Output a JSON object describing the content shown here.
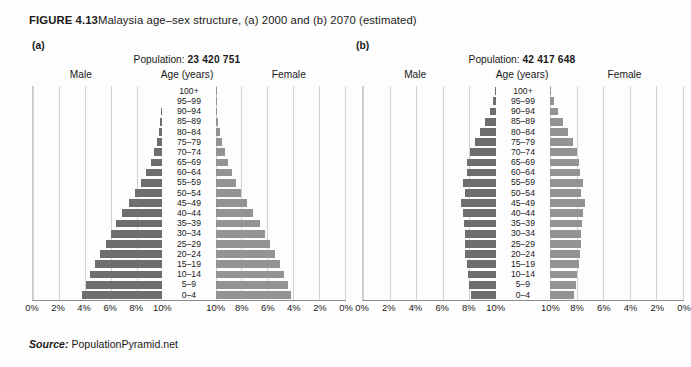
{
  "figure": {
    "number": "FIGURE 4.13",
    "title": "Malaysia age–sex structure, (a) 2000 and (b) 2070 (estimated)"
  },
  "source": {
    "label": "Source:",
    "text": " PopulationPyramid.net"
  },
  "colors": {
    "male_bar": "#6e6e6e",
    "female_bar": "#939393",
    "gridline": "#d2d2d2",
    "axis": "#8c8c8c",
    "background": "#fdfdfd"
  },
  "labels": {
    "population_prefix": "Population: ",
    "male": "Male",
    "female": "Female",
    "age": "Age (years)"
  },
  "panels": [
    {
      "letter": "(a)",
      "population": "23 420 751"
    },
    {
      "letter": "(b)",
      "population": "42 417 648"
    }
  ],
  "chart_data": [
    {
      "type": "bar",
      "subtype": "population-pyramid",
      "title": "Malaysia age–sex structure (a) 2000",
      "panel": "(a)",
      "population_total": "23 420 751",
      "xlabel": "",
      "ylabel": "Age (years)",
      "xlim": [
        0,
        10
      ],
      "xunit": "%",
      "xticks": [
        "10%",
        "8%",
        "6%",
        "4%",
        "2%",
        "0%",
        "0%",
        "2%",
        "4%",
        "6%",
        "8%",
        "10%"
      ],
      "grid": true,
      "legend": [
        "Male",
        "Female"
      ],
      "legend_position": "top",
      "categories": [
        "100+",
        "95–99",
        "90–94",
        "85–89",
        "80–84",
        "75–79",
        "70–74",
        "65–69",
        "60–64",
        "55–59",
        "50–54",
        "45–49",
        "40–44",
        "35–39",
        "30–34",
        "25–29",
        "20–24",
        "15–19",
        "10–14",
        "5–9",
        "0–4"
      ],
      "series": [
        {
          "name": "Male",
          "side": "left",
          "values": [
            0.01,
            0.03,
            0.08,
            0.17,
            0.3,
            0.45,
            0.65,
            0.9,
            1.25,
            1.65,
            2.1,
            2.6,
            3.1,
            3.6,
            4.0,
            4.4,
            4.8,
            5.2,
            5.6,
            5.9,
            6.2
          ]
        },
        {
          "name": "Female",
          "side": "right",
          "values": [
            0.01,
            0.04,
            0.1,
            0.2,
            0.34,
            0.5,
            0.7,
            0.95,
            1.25,
            1.6,
            2.0,
            2.45,
            2.9,
            3.4,
            3.8,
            4.2,
            4.6,
            5.0,
            5.3,
            5.6,
            5.85
          ]
        }
      ]
    },
    {
      "type": "bar",
      "subtype": "population-pyramid",
      "title": "Malaysia age–sex structure (b) 2070 (estimated)",
      "panel": "(b)",
      "population_total": "42 417 648",
      "xlabel": "",
      "ylabel": "Age (years)",
      "xlim": [
        0,
        10
      ],
      "xunit": "%",
      "xticks": [
        "10%",
        "8%",
        "6%",
        "4%",
        "2%",
        "0%",
        "0%",
        "2%",
        "4%",
        "6%",
        "8%",
        "10%"
      ],
      "grid": true,
      "legend": [
        "Male",
        "Female"
      ],
      "legend_position": "top",
      "categories": [
        "100+",
        "95–99",
        "90–94",
        "85–89",
        "80–84",
        "75–79",
        "70–74",
        "65–69",
        "60–64",
        "55–59",
        "50–54",
        "45–49",
        "40–44",
        "35–39",
        "30–34",
        "25–29",
        "20–24",
        "15–19",
        "10–14",
        "5–9",
        "0–4"
      ],
      "series": [
        {
          "name": "Male",
          "side": "left",
          "values": [
            0.05,
            0.18,
            0.42,
            0.78,
            1.2,
            1.6,
            1.95,
            2.15,
            2.2,
            2.45,
            2.35,
            2.6,
            2.5,
            2.4,
            2.3,
            2.35,
            2.3,
            2.2,
            2.1,
            2.0,
            1.85
          ]
        },
        {
          "name": "Female",
          "side": "right",
          "values": [
            0.09,
            0.28,
            0.58,
            0.95,
            1.35,
            1.75,
            2.05,
            2.2,
            2.25,
            2.45,
            2.35,
            2.6,
            2.5,
            2.4,
            2.3,
            2.3,
            2.25,
            2.15,
            2.05,
            1.95,
            1.8
          ]
        }
      ]
    }
  ]
}
